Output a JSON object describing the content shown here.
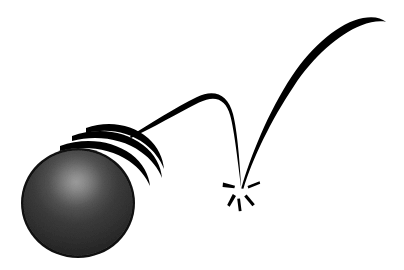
{
  "illustration": {
    "title": "Bouncing Ball Motion Study",
    "subject": "bouncing-ball",
    "style": "black-and-white line art",
    "canvas": {
      "width": 404,
      "height": 270,
      "background_color": "#ffffff"
    },
    "ink_color": "#000000",
    "elements_description": "A dark sphere at lower left with three crescent speed lines behind it, an arcing flight path to an impact burst at center, and a rebound arc rising to the upper right."
  },
  "ball": {
    "name": "ball",
    "center_x": 78,
    "center_y": 203,
    "radius_x": 57,
    "radius_y": 55,
    "fill_color": "#343434",
    "rim_color": "#111111",
    "highlight_color": "#8e8e8e",
    "highlight_x": 78,
    "highlight_y": 182,
    "texture": "grainy stipple"
  },
  "speed_trails": {
    "name": "speed-trails",
    "count": 3,
    "color": "#000000",
    "description": "Three nested crescent arcs trailing the ball toward the upper right",
    "arcs": [
      {
        "label": "trail-inner",
        "thickness": 5.2,
        "offset": 8
      },
      {
        "label": "trail-middle",
        "thickness": 4.6,
        "offset": 19
      },
      {
        "label": "trail-outer",
        "thickness": 4.0,
        "offset": 30
      }
    ]
  },
  "trajectory": {
    "name": "trajectory",
    "color": "#000000",
    "arcs": [
      {
        "label": "first-bounce-arc",
        "start_x": 130,
        "start_y": 136,
        "apex_x": 196,
        "apex_y": 97,
        "end_x": 241,
        "end_y": 188,
        "start_thickness": 0.4,
        "max_thickness": 6.5,
        "end_thickness": 0.6
      },
      {
        "label": "rebound-arc",
        "start_x": 241,
        "start_y": 188,
        "apex_x": 340,
        "apex_y": 24,
        "end_x": 386,
        "end_y": 22,
        "start_thickness": 0.5,
        "max_thickness": 6.0,
        "end_thickness": 0.4
      }
    ]
  },
  "impact": {
    "name": "impact-burst",
    "center_x": 241,
    "center_y": 189,
    "color": "#000000",
    "spoke_count": 5,
    "spokes": [
      {
        "label": "spoke-left",
        "angle_deg": 186,
        "length": 14,
        "width": 4.4
      },
      {
        "label": "spoke-right",
        "angle_deg": 352,
        "length": 14,
        "width": 4.6
      },
      {
        "label": "spoke-lower-left",
        "angle_deg": 117,
        "length": 15,
        "width": 5.0
      },
      {
        "label": "spoke-lower-right",
        "angle_deg": 60,
        "length": 15,
        "width": 5.0
      },
      {
        "label": "spoke-bottom",
        "angle_deg": 88,
        "length": 13,
        "width": 4.6
      }
    ]
  }
}
